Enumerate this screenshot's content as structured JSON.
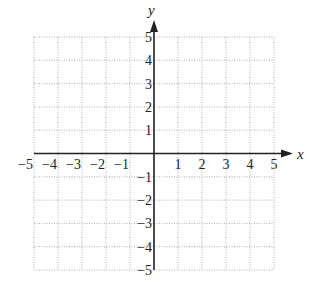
{
  "chart_data": {
    "type": "scatter",
    "title": "",
    "xlabel": "x",
    "ylabel": "y",
    "xlim": [
      -5,
      5
    ],
    "ylim": [
      -5,
      5
    ],
    "grid": true,
    "grid_style": "dotted",
    "series": [],
    "x_ticks": [
      -5,
      -4,
      -3,
      -2,
      -1,
      1,
      2,
      3,
      4,
      5
    ],
    "y_ticks": [
      -5,
      -4,
      -3,
      -2,
      -1,
      1,
      2,
      3,
      4,
      5
    ],
    "x_tick_labels": [
      "−5",
      "−4",
      "−3",
      "−2",
      "−1",
      "1",
      "2",
      "3",
      "4",
      "5"
    ],
    "y_tick_labels": [
      "−5",
      "−4",
      "−3",
      "−2",
      "−1",
      "1",
      "2",
      "3",
      "4",
      "5"
    ],
    "legend": null,
    "annotations": []
  },
  "colors": {
    "axis": "#222222",
    "grid": "#9a9a9a",
    "background": "#ffffff"
  },
  "layout": {
    "x0_px": 34,
    "x1_px": 274,
    "y_top_px": 37,
    "y_bottom_px": 270,
    "origin_x_px": 154,
    "origin_y_px": 153,
    "x_arrow_tip_px": 293,
    "y_arrow_tip_px": 20
  }
}
